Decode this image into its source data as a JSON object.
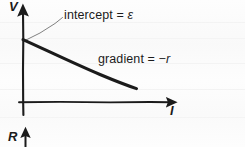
{
  "figure": {
    "type": "hand-drawn-line-graph",
    "background_color": "#fdfdfd",
    "ink_color": "#1b1b1b"
  },
  "axes": {
    "y_label": "V",
    "x_label": "I",
    "origin_px": [
      23,
      102
    ],
    "y_axis_top_px": [
      23,
      8
    ],
    "x_axis_end_px": [
      175,
      102
    ],
    "y_axis_bottom_px": [
      23,
      115
    ]
  },
  "line": {
    "name": "v-against-i-line",
    "start_px": [
      23,
      40
    ],
    "end_px": [
      136,
      88
    ],
    "intercept_value": "ε",
    "gradient_value": "−r"
  },
  "annotations": [
    {
      "id": "intercept",
      "text_prefix": "intercept = ",
      "symbol": "ε",
      "full_text": "intercept = ε",
      "leader_from_px": [
        24,
        40
      ],
      "leader_to_px": [
        62,
        17
      ]
    },
    {
      "id": "gradient",
      "text_prefix": "gradient = ",
      "symbol": "−r",
      "full_text": "gradient = −r"
    }
  ],
  "second_figure": {
    "y_label": "R",
    "note": "top of a second graph, cropped at page bottom"
  },
  "colors": {
    "ink": "#1b1b1b",
    "paper": "#fdfdfd",
    "rule": "#f2f2f2",
    "leader": "#666666"
  }
}
